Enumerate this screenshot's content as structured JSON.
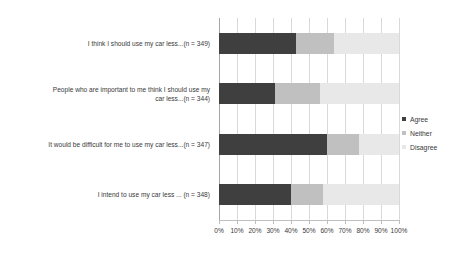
{
  "chart_data": {
    "type": "bar",
    "orientation": "horizontal",
    "stacked": true,
    "stacked_mode": "percent",
    "title": "",
    "xlabel": "",
    "ylabel": "",
    "xlim": [
      0,
      100
    ],
    "grid": true,
    "legend_position": "right",
    "categories": [
      "I think I should use my car less...(n = 349)",
      "People who are important to me think I should use my car less...(n = 344)",
      "It would be difficult for me to use my car less...(n = 347)",
      "I intend to use my car less ... (n = 348)"
    ],
    "category_lines": [
      [
        "I think I should use my car less...(n = 349)"
      ],
      [
        "People who are important to me think I should use my",
        "car less...(n = 344)"
      ],
      [
        "It would be difficult for me to use my car less...(n = 347)"
      ],
      [
        "I intend to use my car less ... (n = 348)"
      ]
    ],
    "series": [
      {
        "name": "Agree",
        "color": "#3f3f3f",
        "values": [
          43,
          31,
          60,
          40
        ]
      },
      {
        "name": "Neither",
        "color": "#c0c0c0",
        "values": [
          21,
          25,
          18,
          18
        ]
      },
      {
        "name": "Disagree",
        "color": "#e8e8e8",
        "values": [
          36,
          44,
          22,
          42
        ]
      }
    ],
    "xticks": [
      0,
      10,
      20,
      30,
      40,
      50,
      60,
      70,
      80,
      90,
      100
    ],
    "xticklabels": [
      "0%",
      "10%",
      "20%",
      "30%",
      "40%",
      "50%",
      "60%",
      "70%",
      "80%",
      "90%",
      "100%"
    ]
  },
  "legend": {
    "items": [
      {
        "label": "Agree"
      },
      {
        "label": "Neither"
      },
      {
        "label": "Disagree"
      }
    ]
  },
  "colors": {
    "agree": "#3f3f3f",
    "neither": "#c0c0c0",
    "disagree": "#e8e8e8",
    "gridline": "#d9d9d9",
    "axis": "#bfbfbf",
    "text": "#3a3a3a",
    "background": "#ffffff"
  }
}
